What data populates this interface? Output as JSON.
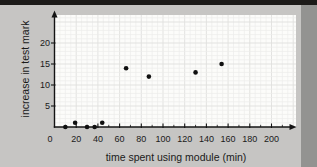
{
  "page": {
    "background_color": "#c6c5c3",
    "top_bar_color": "#1d1b19",
    "edge_band_color": "#939391"
  },
  "chart_data": {
    "type": "scatter",
    "title": "",
    "xlabel": "time spent using module (min)",
    "ylabel": "increase in test mark",
    "origin_label": "0",
    "x_ticks": [
      20,
      40,
      60,
      80,
      100,
      120,
      140,
      160,
      180,
      200
    ],
    "x_minor_ticks": [
      10,
      30,
      50,
      70,
      90,
      110,
      130,
      150,
      170,
      190,
      210
    ],
    "y_ticks": [
      5,
      10,
      15,
      20
    ],
    "xlim": [
      0,
      222
    ],
    "ylim": [
      0,
      26
    ],
    "grid": "on",
    "legend": "none",
    "point_color": "#101010",
    "axis_color": "#141414",
    "plot_background": "#fcfcfa",
    "points": [
      {
        "x": 10,
        "y": 0
      },
      {
        "x": 19,
        "y": 1
      },
      {
        "x": 30,
        "y": 0
      },
      {
        "x": 37,
        "y": 0
      },
      {
        "x": 44,
        "y": 1
      },
      {
        "x": 66,
        "y": 14
      },
      {
        "x": 87,
        "y": 12
      },
      {
        "x": 130,
        "y": 13
      },
      {
        "x": 154,
        "y": 15
      }
    ]
  }
}
